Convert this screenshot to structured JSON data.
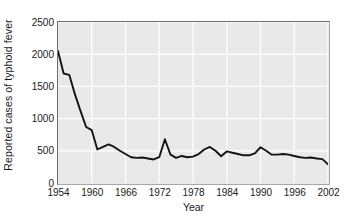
{
  "chart_data": {
    "type": "line",
    "title": "",
    "xlabel": "Year",
    "ylabel": "Reported cases of typhoid fever",
    "xlim": [
      1954,
      2002
    ],
    "ylim": [
      0,
      2500
    ],
    "grid": true,
    "legend": null,
    "legend_position": "none",
    "line_color": "#141414",
    "plot_background": "#e9e9e9",
    "gridline_color": "#ffffff",
    "frame_color": "#6e6e6e",
    "xticks": [
      1954,
      1960,
      1966,
      1972,
      1978,
      1984,
      1990,
      1996,
      2002
    ],
    "xtick_labels": [
      "1954",
      "1960",
      "1966",
      "1972",
      "1978",
      "1984",
      "1990",
      "1996",
      "2002"
    ],
    "yticks": [
      0,
      500,
      1000,
      1500,
      2000,
      2500
    ],
    "ytick_labels": [
      "0",
      "500",
      "1000",
      "1500",
      "2000",
      "2500"
    ],
    "x": [
      1954,
      1955,
      1956,
      1957,
      1958,
      1959,
      1960,
      1961,
      1962,
      1963,
      1964,
      1965,
      1966,
      1967,
      1968,
      1969,
      1970,
      1971,
      1972,
      1973,
      1974,
      1975,
      1976,
      1977,
      1978,
      1979,
      1980,
      1981,
      1982,
      1983,
      1984,
      1985,
      1986,
      1987,
      1988,
      1989,
      1990,
      1991,
      1992,
      1993,
      1994,
      1995,
      1996,
      1997,
      1998,
      1999,
      2000,
      2001,
      2002
    ],
    "series": [
      {
        "name": "Reported cases of typhoid fever",
        "values": [
          2050,
          1700,
          1680,
          1380,
          1120,
          870,
          820,
          520,
          560,
          600,
          560,
          500,
          450,
          400,
          390,
          395,
          380,
          365,
          400,
          680,
          440,
          390,
          420,
          400,
          410,
          450,
          520,
          560,
          500,
          415,
          490,
          470,
          450,
          430,
          430,
          460,
          555,
          500,
          440,
          440,
          450,
          440,
          420,
          400,
          390,
          395,
          380,
          370,
          290
        ]
      }
    ]
  }
}
